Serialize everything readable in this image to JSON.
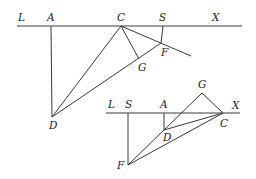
{
  "figure_top": {
    "labels": {
      "L": "L",
      "A": "A",
      "C": "C",
      "S": "S",
      "X": "X",
      "F": "F",
      "G": "G",
      "D": "D"
    },
    "points": {
      "A": [
        51,
        26
      ],
      "C": [
        121,
        26
      ],
      "S": [
        163,
        26
      ],
      "F": [
        161,
        43
      ],
      "G": [
        139,
        59
      ],
      "D": [
        52,
        117
      ]
    }
  },
  "figure_bottom": {
    "labels": {
      "L": "L",
      "S": "S",
      "A": "A",
      "G": "G",
      "X": "X",
      "C": "C",
      "D": "D",
      "F": "F"
    },
    "points": {
      "S": [
        128,
        113
      ],
      "A": [
        164,
        113
      ],
      "C": [
        223,
        113
      ],
      "G": [
        202,
        93
      ],
      "D": [
        164,
        130
      ],
      "F": [
        128,
        165
      ]
    }
  }
}
